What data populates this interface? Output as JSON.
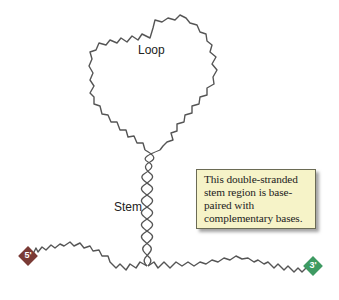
{
  "diagram": {
    "labels": {
      "loop": "Loop",
      "stem": "Stem"
    },
    "callout": {
      "text": "This double-stranded stem region is base-paired with complementary bases."
    },
    "ends": {
      "five_prime": {
        "label": "5'",
        "color": "#7a3a35"
      },
      "three_prime": {
        "label": "3'",
        "color": "#3e9a62"
      }
    },
    "colors": {
      "strand": "#555555",
      "callout_bg": "#f6f3c8",
      "callout_border": "#6b6b55"
    }
  }
}
